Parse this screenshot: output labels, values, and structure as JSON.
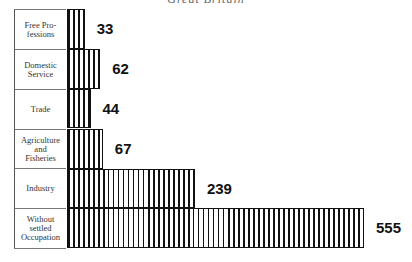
{
  "title": "Great Britain",
  "chart_data": {
    "type": "bar",
    "orientation": "horizontal",
    "title": "Great Britain",
    "categories": [
      "Free Professions",
      "Domestic Service",
      "Trade",
      "Agriculture and Fisheries",
      "Industry",
      "Without settled Occupation"
    ],
    "category_labels": [
      "Free Pro-\nfessions",
      "Domestic\nService",
      "Trade",
      "Agriculture\nand\nFisheries",
      "Industry",
      "Without\nsettled\nOccupation"
    ],
    "values": [
      33,
      62,
      44,
      67,
      239,
      555
    ],
    "value_labels": [
      "33",
      "62",
      "44",
      "67",
      "239",
      "555"
    ],
    "xlabel": "",
    "ylabel": "",
    "grid": false,
    "fill": "vertical-hatch"
  }
}
